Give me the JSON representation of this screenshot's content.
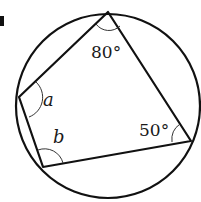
{
  "diagram": {
    "type": "cyclic-quadrilateral",
    "circle": {
      "cx": 108,
      "cy": 106,
      "r": 92
    },
    "vertices": {
      "top": [
        108,
        12
      ],
      "left": [
        19,
        97
      ],
      "bottom_left": [
        43,
        167
      ],
      "right": [
        191,
        141
      ]
    },
    "angles": {
      "top": "80°",
      "right": "50°",
      "left": "a",
      "bottom_left": "b"
    },
    "stroke_color": "#111111"
  }
}
